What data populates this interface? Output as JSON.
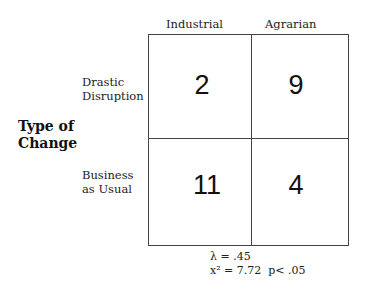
{
  "table": {
    "column_headers": [
      "Industrial",
      "Agrarian"
    ],
    "row_axis_title": [
      "Type of",
      "Change"
    ],
    "rows": [
      {
        "label": [
          "Drastic",
          "Disruption"
        ],
        "values": [
          "2",
          "9"
        ]
      },
      {
        "label": [
          "Business",
          "as Usual"
        ],
        "values": [
          "11",
          "4"
        ]
      }
    ]
  },
  "statistics": {
    "lambda": "λ = .45",
    "chi_square_line": "x² = 7.72  p< .05"
  }
}
